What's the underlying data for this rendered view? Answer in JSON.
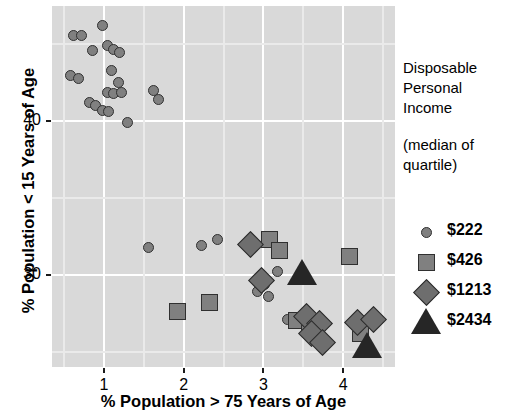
{
  "chart_data": {
    "type": "scatter",
    "title": "",
    "xlabel": "% Population > 75 Years of Age",
    "ylabel": "% Population < 15 Years of Age",
    "xlim": [
      0.35,
      4.65
    ],
    "ylim": [
      24.0,
      47.5
    ],
    "xticks": [
      1,
      2,
      3,
      4
    ],
    "yticks": [
      30,
      40
    ],
    "xtick_labels": [
      "1",
      "2",
      "3",
      "4"
    ],
    "ytick_labels": [
      "30",
      "40"
    ],
    "grid": true,
    "legend_position": "right",
    "legend": {
      "title_lines": [
        "Disposable",
        "Personal",
        "Income"
      ],
      "subtitle_lines": [
        "(median of",
        "quartile)"
      ],
      "entries": [
        {
          "label": "$222",
          "marker": "circle",
          "fill": "#808080",
          "stroke": "#303030"
        },
        {
          "label": "$426",
          "marker": "square",
          "fill": "#808080",
          "stroke": "#303030"
        },
        {
          "label": "$1213",
          "marker": "diamond",
          "fill": "#6e6e6e",
          "stroke": "#2b2b2b"
        },
        {
          "label": "$2434",
          "marker": "triangle",
          "fill": "#262626",
          "stroke": "#262626"
        }
      ]
    },
    "series": [
      {
        "name": "$222",
        "marker": "circle",
        "points": [
          [
            0.62,
            45.6
          ],
          [
            0.72,
            45.6
          ],
          [
            0.98,
            46.2
          ],
          [
            0.86,
            44.6
          ],
          [
            1.04,
            44.9
          ],
          [
            1.12,
            44.7
          ],
          [
            1.2,
            44.5
          ],
          [
            0.58,
            43.0
          ],
          [
            0.68,
            42.8
          ],
          [
            1.1,
            43.3
          ],
          [
            1.18,
            42.5
          ],
          [
            1.04,
            41.9
          ],
          [
            1.12,
            41.8
          ],
          [
            1.22,
            41.9
          ],
          [
            0.82,
            41.2
          ],
          [
            0.9,
            41.0
          ],
          [
            0.98,
            40.7
          ],
          [
            1.06,
            40.6
          ],
          [
            1.62,
            42.0
          ],
          [
            1.68,
            41.4
          ],
          [
            1.3,
            39.9
          ],
          [
            2.22,
            31.9
          ],
          [
            2.42,
            32.3
          ],
          [
            1.56,
            31.8
          ],
          [
            3.02,
            29.4
          ],
          [
            2.92,
            28.9
          ],
          [
            3.06,
            28.6
          ],
          [
            3.18,
            30.2
          ],
          [
            3.3,
            27.1
          ]
        ]
      },
      {
        "name": "$426",
        "marker": "square",
        "points": [
          [
            1.92,
            27.6
          ],
          [
            2.32,
            28.2
          ],
          [
            3.08,
            32.3
          ],
          [
            3.2,
            31.6
          ],
          [
            4.08,
            31.2
          ],
          [
            3.42,
            27.0
          ],
          [
            3.58,
            26.8
          ],
          [
            4.22,
            26.2
          ]
        ]
      },
      {
        "name": "$1213",
        "marker": "diamond",
        "points": [
          [
            2.84,
            32.0
          ],
          [
            2.98,
            29.6
          ],
          [
            3.54,
            27.3
          ],
          [
            3.7,
            26.8
          ],
          [
            3.6,
            26.2
          ],
          [
            3.74,
            25.6
          ],
          [
            4.18,
            26.9
          ],
          [
            4.38,
            27.1
          ]
        ]
      },
      {
        "name": "$2434",
        "marker": "triangle",
        "points": [
          [
            3.48,
            30.0
          ],
          [
            4.3,
            25.2
          ]
        ]
      }
    ]
  }
}
